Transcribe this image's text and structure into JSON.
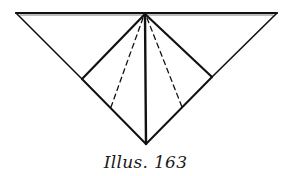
{
  "figure": {
    "caption": "Illus. 163",
    "stroke_color": "#111111",
    "background": "#ffffff"
  },
  "points": {
    "top_left": [
      16,
      13
    ],
    "top_right": [
      277,
      13
    ],
    "apex": [
      145,
      14
    ],
    "bottom": [
      146,
      144
    ],
    "left_corner": [
      82,
      79
    ],
    "right_corner": [
      212,
      77
    ],
    "left_dash_end": [
      111,
      107
    ],
    "right_dash_end": [
      182,
      107
    ]
  }
}
